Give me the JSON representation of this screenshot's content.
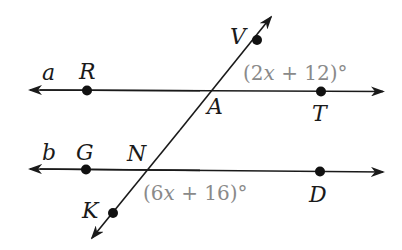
{
  "figure": {
    "type": "parallel-lines-transversal",
    "colors": {
      "line": "#1a1a1a",
      "point": "#111111",
      "label": "#1a1a1a",
      "angle_label": "#8a8a8a",
      "background": "#ffffff"
    }
  },
  "lines": {
    "a": {
      "label": "a"
    },
    "b": {
      "label": "b"
    }
  },
  "points": {
    "R": "R",
    "T": "T",
    "A": "A",
    "V": "V",
    "G": "G",
    "N": "N",
    "D": "D",
    "K": "K"
  },
  "angles": {
    "top": {
      "open": "(2",
      "var": "x",
      "rest": " + 12)°"
    },
    "bottom": {
      "open": "(6",
      "var": "x",
      "rest": " + 16)°"
    }
  }
}
